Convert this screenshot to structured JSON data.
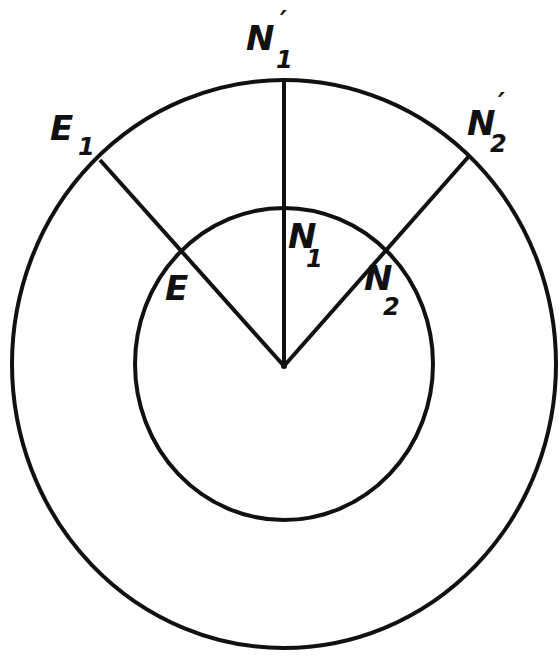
{
  "diagram": {
    "type": "concentric-circles-radial-lines",
    "colors": {
      "line": "#111111",
      "background": "#ffffff"
    },
    "outer_circle": {
      "cx": 284,
      "cy": 364,
      "rx": 272,
      "ry": 284
    },
    "inner_circle": {
      "cx": 284,
      "cy": 364,
      "rx": 149,
      "ry": 156
    },
    "center": {
      "x": 284,
      "y": 366
    },
    "lines": [
      {
        "name": "line-to-E1",
        "x2": 100,
        "y2": 160
      },
      {
        "name": "line-to-N1-prime",
        "x2": 284,
        "y2": 80
      },
      {
        "name": "line-to-N2-prime",
        "x2": 470,
        "y2": 155
      }
    ],
    "labels": {
      "E1": {
        "main": "E",
        "sub": "1",
        "prime": ""
      },
      "N1prime": {
        "main": "N",
        "sub": "1",
        "prime": "′"
      },
      "N2prime": {
        "main": "N",
        "sub": "2",
        "prime": "′"
      },
      "E": {
        "main": "E",
        "sub": "",
        "prime": ""
      },
      "N1": {
        "main": "N",
        "sub": "1",
        "prime": ""
      },
      "N2": {
        "main": "N",
        "sub": "2",
        "prime": ""
      }
    }
  }
}
